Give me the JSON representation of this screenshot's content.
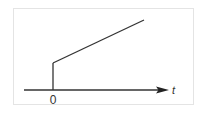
{
  "diagram": {
    "type": "signal-plot",
    "axis": {
      "label": "t",
      "origin_label": "0"
    },
    "signal": {
      "segments": [
        {
          "kind": "step",
          "from": [
            0,
            0
          ],
          "to": [
            0,
            1
          ]
        },
        {
          "kind": "ramp",
          "from": [
            0,
            1
          ],
          "to": [
            1,
            2.6
          ]
        }
      ]
    },
    "colors": {
      "line": "#333333",
      "frame": "#e4e4e4",
      "background": "#ffffff"
    }
  }
}
